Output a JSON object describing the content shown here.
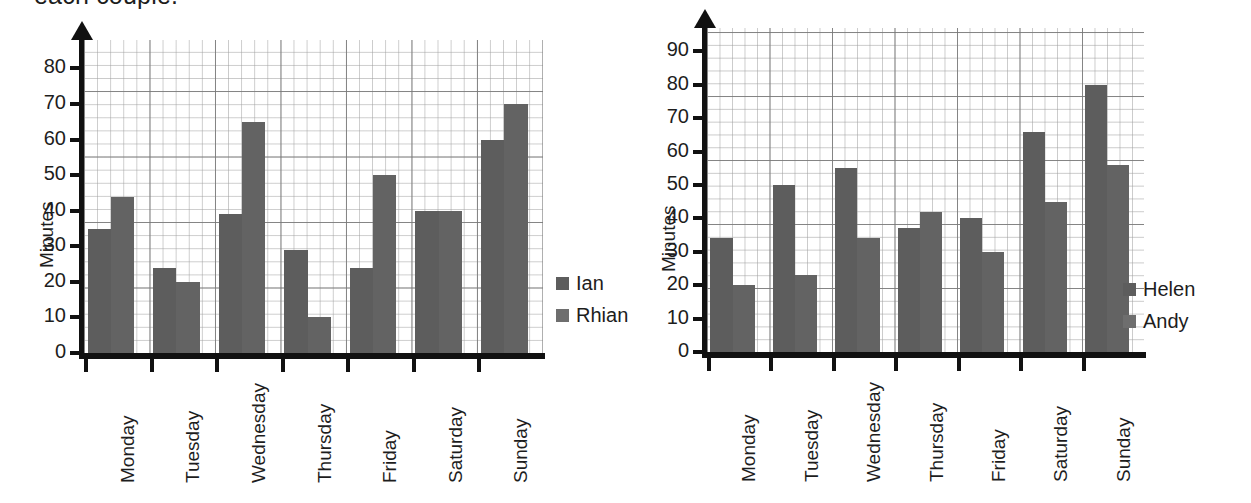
{
  "caption": "each couple.",
  "charts": [
    {
      "id": "chart-left",
      "ylabel": "Minutes",
      "yticks": [
        "0",
        "10",
        "20",
        "30",
        "40",
        "50",
        "60",
        "70",
        "80"
      ],
      "ymin": 0,
      "ymax": 88,
      "categories": [
        "Monday",
        "Tuesday",
        "Wednesday",
        "Thursday",
        "Friday",
        "Saturday",
        "Sunday"
      ],
      "legend": [
        {
          "label": "Ian",
          "color": "#5d5d5d"
        },
        {
          "label": "Rhian",
          "color": "#6e6e6e"
        }
      ],
      "chart_data": {
        "type": "bar",
        "title": "",
        "xlabel": "",
        "ylabel": "Minutes",
        "ylim": [
          0,
          88
        ],
        "yticks": [
          0,
          10,
          20,
          30,
          40,
          50,
          60,
          70,
          80
        ],
        "grid": true,
        "legend_position": "right",
        "categories": [
          "Monday",
          "Tuesday",
          "Wednesday",
          "Thursday",
          "Friday",
          "Saturday",
          "Sunday"
        ],
        "series": [
          {
            "name": "Ian",
            "values": [
              35,
              24,
              39,
              29,
              24,
              40,
              60
            ]
          },
          {
            "name": "Rhian",
            "values": [
              44,
              20,
              65,
              10,
              50,
              40,
              70
            ]
          }
        ]
      }
    },
    {
      "id": "chart-right",
      "ylabel": "Minutes",
      "yticks": [
        "0",
        "10",
        "20",
        "30",
        "40",
        "50",
        "60",
        "70",
        "80",
        "90"
      ],
      "ymin": 0,
      "ymax": 97,
      "categories": [
        "Monday",
        "Tuesday",
        "Wednesday",
        "Thursday",
        "Friday",
        "Saturday",
        "Sunday"
      ],
      "legend": [
        {
          "label": "Helen",
          "color": "#5d5d5d"
        },
        {
          "label": "Andy",
          "color": "#6e6e6e"
        }
      ],
      "chart_data": {
        "type": "bar",
        "title": "",
        "xlabel": "",
        "ylabel": "Minutes",
        "ylim": [
          0,
          97
        ],
        "yticks": [
          0,
          10,
          20,
          30,
          40,
          50,
          60,
          70,
          80,
          90
        ],
        "grid": true,
        "legend_position": "right",
        "categories": [
          "Monday",
          "Tuesday",
          "Wednesday",
          "Thursday",
          "Friday",
          "Saturday",
          "Sunday"
        ],
        "series": [
          {
            "name": "Helen",
            "values": [
              34,
              50,
              55,
              37,
              40,
              66,
              80
            ]
          },
          {
            "name": "Andy",
            "values": [
              20,
              23,
              34,
              42,
              30,
              45,
              56
            ]
          }
        ]
      }
    }
  ]
}
